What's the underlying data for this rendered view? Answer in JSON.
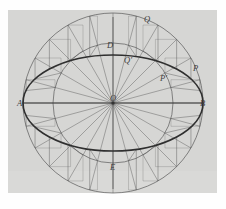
{
  "figure": {
    "background_color": "#d6d6d4",
    "page_color": "#fefefe",
    "ink_color": "#555555",
    "ellipse_ink_color": "#2f2f2f",
    "labels": [
      {
        "text": "A",
        "name": "label-A",
        "x": 17,
        "y": 99,
        "note": "left end of major axis"
      },
      {
        "text": "B",
        "name": "label-B",
        "x": 200,
        "y": 99,
        "note": "right end of major axis"
      },
      {
        "text": "D",
        "name": "label-D",
        "x": 107,
        "y": 41,
        "note": "top end of minor axis"
      },
      {
        "text": "E",
        "name": "label-E",
        "x": 110,
        "y": 163,
        "note": "bottom end of minor axis"
      },
      {
        "text": "O",
        "name": "label-O",
        "x": 110,
        "y": 94,
        "note": "centre"
      },
      {
        "text": "Q",
        "name": "label-Q",
        "x": 144,
        "y": 15,
        "note": "point on outer circle"
      },
      {
        "text": "Q'",
        "name": "label-Q-prime",
        "x": 124,
        "y": 56,
        "note": "point on inner circle"
      },
      {
        "text": "P",
        "name": "label-P",
        "x": 193,
        "y": 64,
        "note": "point on outer circle"
      },
      {
        "text": "P'",
        "name": "label-P-prime",
        "x": 160,
        "y": 74,
        "note": "point on inner circle"
      }
    ],
    "geometry": {
      "center": {
        "x": 113,
        "y": 103
      },
      "outer_circle_radius": 90,
      "inner_circle_radius": 60,
      "ellipse_semi_major": 90,
      "ellipse_semi_minor": 48,
      "radial_line_angles_deg": [
        0,
        15,
        30,
        45,
        60,
        75,
        90,
        105,
        120,
        135,
        150,
        165,
        180,
        195,
        210,
        225,
        240,
        255,
        270,
        285,
        300,
        315,
        330,
        345
      ],
      "construction_angles_deg": [
        15,
        30,
        45,
        60,
        75,
        105,
        120,
        135,
        150,
        165,
        195,
        210,
        225,
        240,
        255,
        285,
        300,
        315,
        330,
        345
      ]
    }
  }
}
